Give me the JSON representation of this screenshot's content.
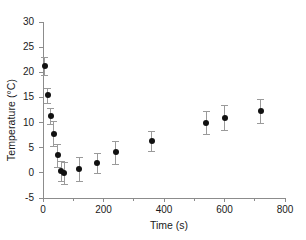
{
  "chart_data": {
    "type": "scatter",
    "title": "",
    "xlabel": "Time (s)",
    "ylabel": "Temperature (°C)",
    "xlim": [
      0,
      800
    ],
    "ylim": [
      -5,
      30
    ],
    "grid": false,
    "legend": null,
    "error_bars": "symmetric-vertical",
    "x_major_ticks": [
      0,
      200,
      400,
      600,
      800
    ],
    "x_minor_ticks": [
      100,
      300,
      500,
      700
    ],
    "x_ticklabels": [
      "0",
      "200",
      "400",
      "600",
      "800"
    ],
    "y_major_ticks": [
      -5,
      0,
      5,
      10,
      15,
      20,
      25,
      30
    ],
    "y_ticklabels": [
      "-5",
      "0",
      "5",
      "10",
      "15",
      "20",
      "25",
      "30"
    ],
    "marker": "filled-circle",
    "marker_color": "#111111",
    "errorbar_color": "#9a9a9a",
    "axis_color": "#8c8c8c",
    "x": [
      5,
      15,
      25,
      35,
      48,
      60,
      70,
      120,
      180,
      240,
      360,
      540,
      600,
      720
    ],
    "y": [
      21.2,
      15.4,
      11.3,
      7.8,
      3.5,
      0.4,
      -0.1,
      0.7,
      2.0,
      4.1,
      6.4,
      10.0,
      11.0,
      12.3
    ],
    "yerr": [
      1.8,
      1.5,
      1.6,
      2.5,
      2.3,
      2.0,
      2.2,
      2.4,
      2.0,
      2.3,
      2.0,
      2.3,
      2.4,
      2.3
    ],
    "series": [
      {
        "name": "Temperature",
        "points": [
          {
            "x": 5,
            "y": 21.2,
            "yerr": 1.8
          },
          {
            "x": 15,
            "y": 15.4,
            "yerr": 1.5
          },
          {
            "x": 25,
            "y": 11.3,
            "yerr": 1.6
          },
          {
            "x": 35,
            "y": 7.8,
            "yerr": 2.5
          },
          {
            "x": 48,
            "y": 3.5,
            "yerr": 2.3
          },
          {
            "x": 60,
            "y": 0.4,
            "yerr": 2.0
          },
          {
            "x": 70,
            "y": -0.1,
            "yerr": 2.2
          },
          {
            "x": 120,
            "y": 0.7,
            "yerr": 2.4
          },
          {
            "x": 180,
            "y": 2.0,
            "yerr": 2.0
          },
          {
            "x": 240,
            "y": 4.1,
            "yerr": 2.3
          },
          {
            "x": 360,
            "y": 6.4,
            "yerr": 2.0
          },
          {
            "x": 540,
            "y": 10.0,
            "yerr": 2.3
          },
          {
            "x": 600,
            "y": 11.0,
            "yerr": 2.4
          },
          {
            "x": 720,
            "y": 12.3,
            "yerr": 2.3
          }
        ]
      }
    ]
  },
  "axes": {
    "x_title": "Time (s)",
    "y_title": "Temperature (°C)"
  }
}
